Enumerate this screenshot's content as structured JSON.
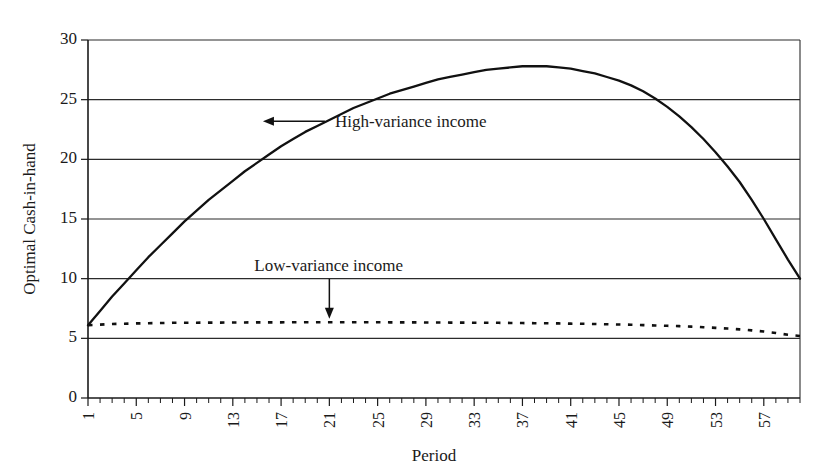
{
  "chart_data": {
    "type": "line",
    "title": "",
    "xlabel": "Period",
    "ylabel": "Optimal Cash-in-hand",
    "xlim": [
      1,
      60
    ],
    "ylim": [
      0,
      30
    ],
    "grid": true,
    "legend_position": "inline-annotations",
    "x_ticks": [
      1,
      5,
      9,
      13,
      17,
      21,
      25,
      29,
      33,
      37,
      41,
      45,
      49,
      53,
      57
    ],
    "y_ticks": [
      0,
      5,
      10,
      15,
      20,
      25,
      30
    ],
    "x_tick_step_minor": 1,
    "annotations": [
      {
        "name": "high-variance-annotation",
        "text": "High-variance income",
        "arrow_direction": "left",
        "points_at_period": 15,
        "points_at_value": 23.2
      },
      {
        "name": "low-variance-annotation",
        "text": "Low-variance income",
        "arrow_direction": "down",
        "points_at_period": 21,
        "points_at_value": 6.3
      }
    ],
    "series": [
      {
        "name": "High-variance income",
        "style": "solid",
        "x": [
          1,
          2,
          3,
          4,
          5,
          6,
          7,
          8,
          9,
          10,
          11,
          12,
          13,
          14,
          15,
          16,
          17,
          18,
          19,
          20,
          21,
          22,
          23,
          24,
          25,
          26,
          27,
          28,
          29,
          30,
          31,
          32,
          33,
          34,
          35,
          36,
          37,
          38,
          39,
          40,
          41,
          42,
          43,
          44,
          45,
          46,
          47,
          48,
          49,
          50,
          51,
          52,
          53,
          54,
          55,
          56,
          57,
          58,
          59,
          60
        ],
        "values": [
          6.1,
          7.3,
          8.5,
          9.6,
          10.7,
          11.8,
          12.8,
          13.8,
          14.8,
          15.7,
          16.6,
          17.4,
          18.2,
          19.0,
          19.7,
          20.4,
          21.1,
          21.7,
          22.3,
          22.8,
          23.3,
          23.8,
          24.3,
          24.7,
          25.1,
          25.5,
          25.8,
          26.1,
          26.4,
          26.7,
          26.9,
          27.1,
          27.3,
          27.5,
          27.6,
          27.7,
          27.8,
          27.8,
          27.8,
          27.7,
          27.6,
          27.4,
          27.2,
          26.9,
          26.6,
          26.2,
          25.7,
          25.1,
          24.4,
          23.6,
          22.7,
          21.7,
          20.6,
          19.4,
          18.1,
          16.6,
          15.0,
          13.3,
          11.6,
          10.0
        ]
      },
      {
        "name": "Low-variance income",
        "style": "dashed",
        "x": [
          1,
          2,
          3,
          4,
          5,
          6,
          7,
          8,
          9,
          10,
          11,
          12,
          13,
          14,
          15,
          16,
          17,
          18,
          19,
          20,
          21,
          22,
          23,
          24,
          25,
          26,
          27,
          28,
          29,
          30,
          31,
          32,
          33,
          34,
          35,
          36,
          37,
          38,
          39,
          40,
          41,
          42,
          43,
          44,
          45,
          46,
          47,
          48,
          49,
          50,
          51,
          52,
          53,
          54,
          55,
          56,
          57,
          58,
          59,
          60
        ],
        "values": [
          6.1,
          6.15,
          6.2,
          6.22,
          6.25,
          6.27,
          6.28,
          6.3,
          6.3,
          6.31,
          6.32,
          6.32,
          6.33,
          6.33,
          6.34,
          6.34,
          6.34,
          6.35,
          6.35,
          6.35,
          6.35,
          6.35,
          6.35,
          6.35,
          6.35,
          6.34,
          6.34,
          6.34,
          6.33,
          6.33,
          6.32,
          6.32,
          6.31,
          6.3,
          6.3,
          6.29,
          6.28,
          6.27,
          6.26,
          6.25,
          6.23,
          6.22,
          6.2,
          6.18,
          6.16,
          6.14,
          6.11,
          6.08,
          6.05,
          6.02,
          5.98,
          5.93,
          5.88,
          5.82,
          5.75,
          5.67,
          5.57,
          5.45,
          5.3,
          5.2
        ]
      }
    ]
  },
  "colors": {
    "background": "#ffffff",
    "axis": "#1a1a1a",
    "grid": "#2b2b2b",
    "series": "#111111"
  }
}
